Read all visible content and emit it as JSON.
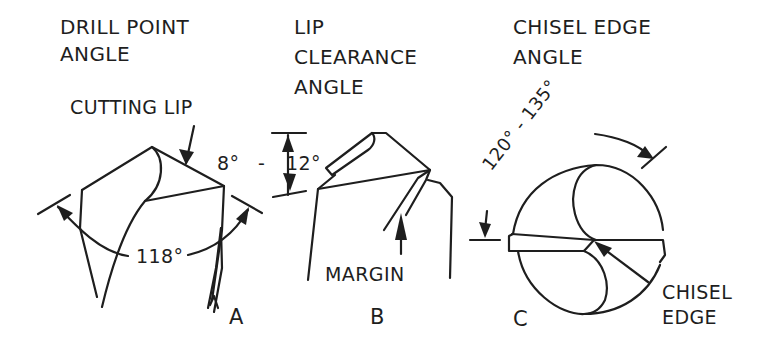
{
  "diagram": {
    "colors": {
      "ink": "#1e1e1e",
      "background": "#ffffff"
    },
    "panels": [
      {
        "id": "A",
        "letter": "A",
        "title_line1": "DRILL POINT",
        "title_line2": "ANGLE",
        "callout": "CUTTING LIP",
        "angle_label": "118°"
      },
      {
        "id": "B",
        "letter": "B",
        "title_line1": "LIP",
        "title_line2": "CLEARANCE",
        "title_line3": "ANGLE",
        "angle_label_low": "8°",
        "angle_dash": "-",
        "angle_label_high": "12°",
        "callout": "MARGIN"
      },
      {
        "id": "C",
        "letter": "C",
        "title_line1": "CHISEL EDGE",
        "title_line2": "ANGLE",
        "angle_label": "120° - 135°",
        "callout_line1": "CHISEL",
        "callout_line2": "EDGE"
      }
    ]
  }
}
